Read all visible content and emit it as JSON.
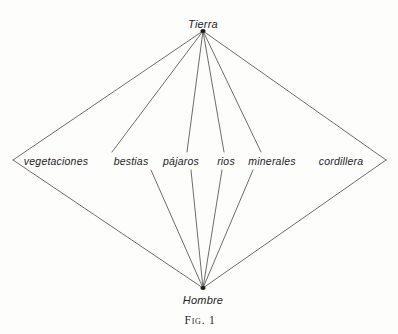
{
  "figure": {
    "caption": "Fig. 1",
    "apex_top": {
      "label": "Tierra",
      "x": 203,
      "y": 24
    },
    "apex_bottom": {
      "label": "Hombre",
      "x": 203,
      "y": 300
    },
    "caption_position": {
      "x": 200,
      "y": 320
    },
    "vertex_top": {
      "x": 203,
      "y": 31
    },
    "vertex_bottom": {
      "x": 203,
      "y": 288
    },
    "middle_nodes": [
      {
        "label": "vegetaciones",
        "x": 56,
        "y": 161,
        "vx_left": 13,
        "vx_right": 99,
        "vy": 161
      },
      {
        "label": "bestias",
        "x": 131,
        "y": 161,
        "vx_left": 112,
        "vx_right": 151,
        "vy": 160
      },
      {
        "label": "pájaros",
        "x": 181,
        "y": 161,
        "vx_left": 160,
        "vx_right": 202,
        "vy": 160
      },
      {
        "label": "rios",
        "x": 226,
        "y": 161,
        "vx_left": 213,
        "vx_right": 239,
        "vy": 158
      },
      {
        "label": "minerales",
        "x": 272,
        "y": 161,
        "vx_left": 246,
        "vx_right": 298,
        "vy": 158
      },
      {
        "label": "cordillera",
        "x": 341,
        "y": 161,
        "vx_left": 314,
        "vx_right": 386,
        "vy": 163
      }
    ],
    "edges": [
      {
        "from": "Tierra",
        "to": "vegetaciones",
        "x1": 203,
        "y1": 31,
        "x2": 13,
        "y2": 160
      },
      {
        "from": "vegetaciones",
        "to": "Hombre",
        "x1": 13,
        "y1": 160,
        "x2": 203,
        "y2": 288
      },
      {
        "from": "Tierra",
        "to": "bestias",
        "x1": 203,
        "y1": 31,
        "x2": 112,
        "y2": 152
      },
      {
        "from": "bestias",
        "to": "Hombre",
        "x1": 151,
        "y1": 170,
        "x2": 203,
        "y2": 288
      },
      {
        "from": "Tierra",
        "to": "pajaros",
        "x1": 203,
        "y1": 31,
        "x2": 187,
        "y2": 152
      },
      {
        "from": "pajaros",
        "to": "Hombre",
        "x1": 191,
        "y1": 170,
        "x2": 203,
        "y2": 288
      },
      {
        "from": "Tierra",
        "to": "rios",
        "x1": 203,
        "y1": 31,
        "x2": 224,
        "y2": 152
      },
      {
        "from": "rios",
        "to": "Hombre",
        "x1": 222,
        "y1": 170,
        "x2": 203,
        "y2": 288
      },
      {
        "from": "Tierra",
        "to": "minerales",
        "x1": 203,
        "y1": 31,
        "x2": 261,
        "y2": 152
      },
      {
        "from": "minerales",
        "to": "Hombre",
        "x1": 253,
        "y1": 170,
        "x2": 203,
        "y2": 288
      },
      {
        "from": "Tierra",
        "to": "cordillera",
        "x1": 203,
        "y1": 31,
        "x2": 386,
        "y2": 160
      },
      {
        "from": "cordillera",
        "to": "Hombre",
        "x1": 386,
        "y1": 160,
        "x2": 203,
        "y2": 288
      }
    ],
    "line_color": "#4a4845",
    "text_color": "#24231f",
    "background_color": "#fdfdfc"
  }
}
